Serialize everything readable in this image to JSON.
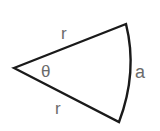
{
  "diagram": {
    "type": "circular-sector",
    "colors": {
      "stroke": "#1a1a1a",
      "label": "#6b6b6b",
      "background": "#ffffff"
    },
    "labels": {
      "radius_top": "r",
      "radius_bottom": "r",
      "angle": "θ",
      "arc": "a"
    }
  }
}
